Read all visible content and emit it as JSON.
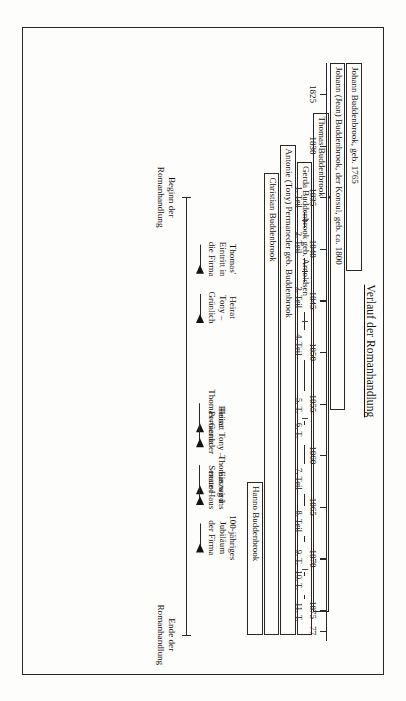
{
  "figure": {
    "title": "Verlauf der Romanhandlung",
    "orientation": "rotated-90",
    "frame_color": "#2b2725"
  },
  "axis": {
    "label": "Jahre",
    "range": [
      1822,
      1878
    ],
    "ticks": [
      {
        "year": 1825,
        "label": "1825"
      },
      {
        "year": 1830,
        "label": "1830"
      },
      {
        "year": 1835,
        "label": "1835"
      },
      {
        "year": 1840,
        "label": "1840"
      },
      {
        "year": 1845,
        "label": "1845"
      },
      {
        "year": 1850,
        "label": "1850"
      },
      {
        "year": 1855,
        "label": "1855"
      },
      {
        "year": 1860,
        "label": "1860"
      },
      {
        "year": 1865,
        "label": "1865"
      },
      {
        "year": 1870,
        "label": "1870"
      },
      {
        "year": 1875,
        "label": "1875"
      },
      {
        "year": 1877,
        "label": "77"
      }
    ],
    "parts": [
      {
        "label": "1. Teil",
        "year": 1835.0
      },
      {
        "label": "2. Teil",
        "year": 1839.4
      },
      {
        "label": "3. Teil",
        "year": 1844.7
      },
      {
        "label": "4. Teil",
        "year": 1849.3
      },
      {
        "label": "5. T.",
        "year": 1855.2
      },
      {
        "label": "6. T.",
        "year": 1857.6
      },
      {
        "label": "7. Teil",
        "year": 1862.3
      },
      {
        "label": "8. Teil",
        "year": 1866.4
      },
      {
        "label": "9. T.",
        "year": 1869.9
      },
      {
        "label": "10. T.",
        "year": 1872.1
      },
      {
        "label": "11. T.",
        "year": 1875.2
      }
    ]
  },
  "characters": [
    {
      "name": "Johann Buddenbrook, geb. 1765",
      "start": 1822.0,
      "end": 1842.2,
      "row": 0
    },
    {
      "name": "Johann (Jean) Buddenbrook, der Konsul, geb. ca. 1800",
      "start": 1822.0,
      "end": 1855.6,
      "row": 1
    },
    {
      "name": "Thomas Buddenbrook",
      "start": 1826.8,
      "end": 1875.2,
      "row": 2
    },
    {
      "name": "Gerda Buddenbrook geb. Arnoldsen",
      "start": 1831.6,
      "end": 1877.4,
      "row": 3
    },
    {
      "name": "Antonie (Tony) Permaneder geb. Buddenbrook",
      "start": 1829.9,
      "end": 1877.4,
      "row": 4
    },
    {
      "name": "Christian Buddenbrook",
      "start": 1832.7,
      "end": 1877.4,
      "row": 5
    },
    {
      "name": "Hanno Buddenbrook",
      "start": 1862.6,
      "end": 1877.4,
      "row": 6
    }
  ],
  "course": {
    "start_year": 1835.0,
    "end_year": 1877.4,
    "start_label_line1": "Beginn der",
    "start_label_line2": "Romanhandlung",
    "end_label_line1": "Ende der",
    "end_label_line2": "Romanhandlung"
  },
  "events": [
    {
      "id": "thomas-eintritt-firma",
      "year": 1841.0,
      "lines": [
        "Thomas'",
        "Eintritt in",
        "die Firma"
      ]
    },
    {
      "id": "heirat-tony-gruenlich",
      "year": 1845.7,
      "lines": [
        "Heirat",
        "Tony –",
        "Grünlich"
      ]
    },
    {
      "id": "heirat-thomas-gerda",
      "year": 1856.3,
      "lines": [
        "Heirat",
        "Thomas–Gerda"
      ]
    },
    {
      "id": "heirat-tony-permaneder",
      "year": 1857.8,
      "lines": [
        "Heirat Tony –",
        "Permaneder"
      ]
    },
    {
      "id": "thomas-wird-senator",
      "year": 1862.3,
      "lines": [
        "Thomas wird",
        "Senator"
      ]
    },
    {
      "id": "einzug-neue-haus",
      "year": 1863.4,
      "lines": [
        "Einzug ins",
        "neue Haus"
      ]
    },
    {
      "id": "jubilaeum-firma",
      "year": 1868.0,
      "lines": [
        "100-jähriges",
        "Jubiläum",
        "der Firma"
      ]
    }
  ]
}
